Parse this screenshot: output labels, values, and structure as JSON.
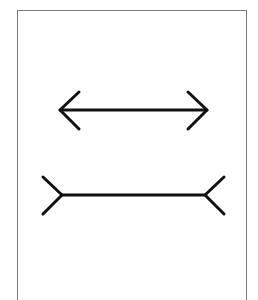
{
  "figure": {
    "type": "muller-lyer-illusion",
    "stroke_color": "#111111",
    "frame_color": "#7a7a7a",
    "top_figure": {
      "name": "arrowheads-outward",
      "shaft": {
        "x1": 60,
        "x2": 207,
        "y": 110
      },
      "fin_length": 19
    },
    "bottom_figure": {
      "name": "fins-inward",
      "shaft": {
        "x1": 62,
        "x2": 205,
        "y": 195
      },
      "fin_length": 19
    }
  }
}
